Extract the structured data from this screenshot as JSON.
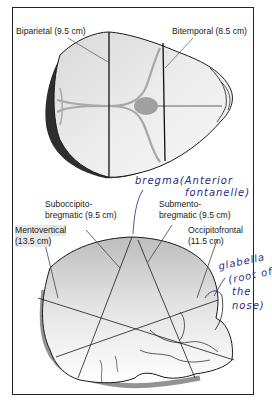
{
  "figure": {
    "type": "fetal-skull-diameters-diagram",
    "top_view": {
      "labels": {
        "biparietal": "Biparietal (9.5 cm)",
        "bitemporal": "Bitemporal (8.5 cm)"
      }
    },
    "side_view": {
      "labels": {
        "suboccipito_line1": "Suboccipito-",
        "suboccipito_line2": "bregmatic (9.5 cm)",
        "submento_line1": "Submento-",
        "submento_line2": "bregmatic (9.5 cm)",
        "mentovertical_line1": "Mentovertical",
        "mentovertical_line2": "(13.5 cm)",
        "occipitofrontal_line1": "Occipitofrontal",
        "occipitofrontal_line2": "(11.5 cm)"
      }
    },
    "annotations": {
      "bregma_line1": "bregma(Anterior",
      "bregma_line2": "fontanelle)",
      "glabella_line1": "glabella",
      "glabella_line2": "(root of",
      "glabella_line3": "the",
      "glabella_line4": "nose)"
    },
    "colors": {
      "skull_fill": "#e6e6e6",
      "suture_gray": "#a8a8a8",
      "outline": "#1a1a1a",
      "shadow": "#3a3a3a",
      "annotation_ink": "#2a2a7a"
    }
  }
}
